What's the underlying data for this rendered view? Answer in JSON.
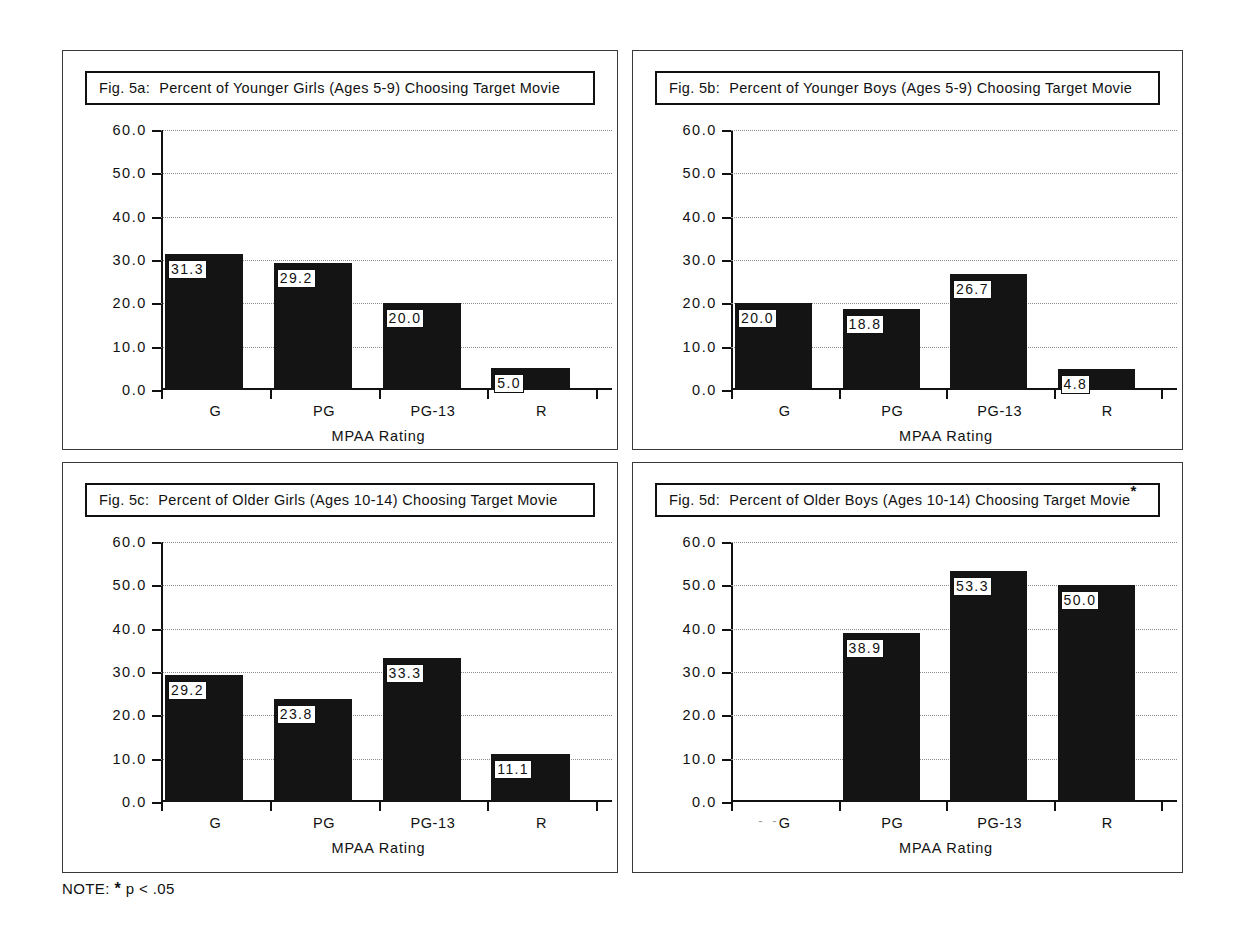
{
  "figure": {
    "note_label": "NOTE:",
    "note_symbol": "*",
    "note_text": "p < .05"
  },
  "panels": [
    {
      "id": "a",
      "fignum": "Fig. 5a:",
      "title": "Percent of Younger Girls (Ages 5-9) Choosing Target Movie",
      "significance_mark": ""
    },
    {
      "id": "b",
      "fignum": "Fig. 5b:",
      "title": "Percent of Younger Boys (Ages 5-9) Choosing Target Movie",
      "significance_mark": ""
    },
    {
      "id": "c",
      "fignum": "Fig. 5c:",
      "title": "Percent of Older Girls (Ages 10-14) Choosing Target Movie",
      "significance_mark": ""
    },
    {
      "id": "d",
      "fignum": "Fig. 5d:",
      "title": "Percent of Older Boys (Ages 10-14) Choosing Target Movie",
      "significance_mark": "*"
    }
  ],
  "axis": {
    "ylabels": [
      "60.0",
      "50.0",
      "40.0",
      "30.0",
      "20.0",
      "10.0",
      "0.0"
    ],
    "xlabels": [
      "G",
      "PG",
      "PG-13",
      "R"
    ],
    "xtitle": "MPAA Rating",
    "ghost_dashes": "- -"
  },
  "chart_data": [
    {
      "type": "bar",
      "panel": "a",
      "title": "Fig. 5a:  Percent of Younger Girls (Ages 5-9) Choosing Target Movie",
      "categories": [
        "G",
        "PG",
        "PG-13",
        "R"
      ],
      "values": [
        31.3,
        29.2,
        20.0,
        5.0
      ],
      "value_labels": [
        "31.3",
        "29.2",
        "20.0",
        "5.0"
      ],
      "xlabel": "MPAA Rating",
      "ylabel": "",
      "ylim": [
        0.0,
        60.0
      ],
      "yticks": [
        0.0,
        10.0,
        20.0,
        30.0,
        40.0,
        50.0,
        60.0
      ],
      "grid": true,
      "legend": "none",
      "bar_color": "#141414"
    },
    {
      "type": "bar",
      "panel": "b",
      "title": "Fig. 5b:  Percent of Younger Boys (Ages 5-9) Choosing Target Movie",
      "categories": [
        "G",
        "PG",
        "PG-13",
        "R"
      ],
      "values": [
        20.0,
        18.8,
        26.7,
        4.8
      ],
      "value_labels": [
        "20.0",
        "18.8",
        "26.7",
        "4.8"
      ],
      "xlabel": "MPAA Rating",
      "ylabel": "",
      "ylim": [
        0.0,
        60.0
      ],
      "yticks": [
        0.0,
        10.0,
        20.0,
        30.0,
        40.0,
        50.0,
        60.0
      ],
      "grid": true,
      "legend": "none",
      "bar_color": "#141414"
    },
    {
      "type": "bar",
      "panel": "c",
      "title": "Fig. 5c:  Percent of Older Girls (Ages 10-14) Choosing Target Movie",
      "categories": [
        "G",
        "PG",
        "PG-13",
        "R"
      ],
      "values": [
        29.2,
        23.8,
        33.3,
        11.1
      ],
      "value_labels": [
        "29.2",
        "23.8",
        "33.3",
        "11.1"
      ],
      "xlabel": "MPAA Rating",
      "ylabel": "",
      "ylim": [
        0.0,
        60.0
      ],
      "yticks": [
        0.0,
        10.0,
        20.0,
        30.0,
        40.0,
        50.0,
        60.0
      ],
      "grid": true,
      "legend": "none",
      "bar_color": "#141414"
    },
    {
      "type": "bar",
      "panel": "d",
      "title": "Fig. 5d:  Percent of Older Boys (Ages 10-14) Choosing Target Movie*",
      "categories": [
        "G",
        "PG",
        "PG-13",
        "R"
      ],
      "values": [
        0.0,
        38.9,
        53.3,
        50.0
      ],
      "value_labels": [
        "",
        "38.9",
        "53.3",
        "50.0"
      ],
      "xlabel": "MPAA Rating",
      "ylabel": "",
      "ylim": [
        0.0,
        60.0
      ],
      "yticks": [
        0.0,
        10.0,
        20.0,
        30.0,
        40.0,
        50.0,
        60.0
      ],
      "grid": true,
      "legend": "none",
      "bar_color": "#141414"
    }
  ]
}
